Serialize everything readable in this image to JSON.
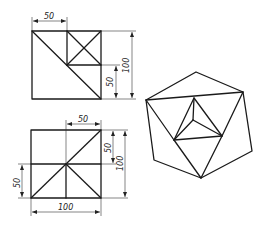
{
  "figure": {
    "type": "engineering drawing: orthographic views and isometric solid",
    "views": [
      {
        "name": "front-view",
        "dimensions": [
          {
            "id": "width-top",
            "label": "50"
          },
          {
            "id": "height-partial",
            "label": "50"
          },
          {
            "id": "height-total",
            "label": "100"
          }
        ]
      },
      {
        "name": "top-view",
        "dimensions": [
          {
            "id": "width-top",
            "label": "50"
          },
          {
            "id": "height-partial-right",
            "label": "50"
          },
          {
            "id": "height-total-right",
            "label": "100"
          },
          {
            "id": "height-partial-left",
            "label": "50"
          },
          {
            "id": "width-bottom",
            "label": "100"
          }
        ]
      },
      {
        "name": "isometric-view",
        "dimensions": []
      }
    ],
    "colors": {
      "line": "#1a1a1a",
      "background": "#ffffff"
    }
  }
}
